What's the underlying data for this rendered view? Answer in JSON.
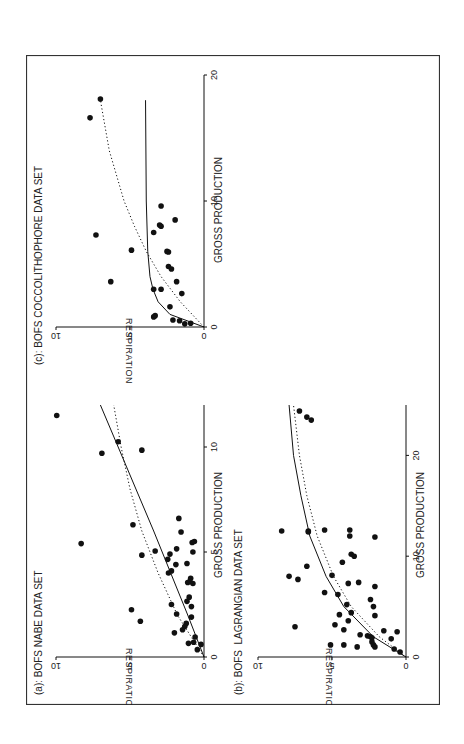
{
  "figure": {
    "rotation_deg": -90,
    "frame_color": "#333333",
    "ink_color": "#111111"
  },
  "chart_data": [
    {
      "id": "a",
      "type": "scatter",
      "title": "(a): BOFS NABE DATA SET",
      "xlabel": "GROSS PRODUCTION",
      "ylabel": "RESPIRATION",
      "xlim": [
        0,
        12
      ],
      "ylim": [
        0,
        10
      ],
      "xticks": [
        0,
        5,
        10
      ],
      "yticks": [
        0,
        5,
        10
      ],
      "grid": false,
      "points": [
        [
          11.5,
          9.95
        ],
        [
          10.25,
          5.8
        ],
        [
          9.7,
          6.9
        ],
        [
          9.85,
          4.2
        ],
        [
          5.4,
          8.3
        ],
        [
          2.25,
          4.9
        ],
        [
          1.7,
          4.3
        ],
        [
          6.3,
          4.8
        ],
        [
          6.6,
          1.7
        ],
        [
          5.95,
          1.55
        ],
        [
          5.45,
          0.8
        ],
        [
          5.5,
          0.65
        ],
        [
          5.0,
          0.75
        ],
        [
          5.05,
          3.3
        ],
        [
          5.15,
          1.85
        ],
        [
          4.9,
          2.3
        ],
        [
          4.85,
          4.2
        ],
        [
          4.65,
          2.45
        ],
        [
          4.45,
          1.15
        ],
        [
          4.4,
          1.9
        ],
        [
          4.1,
          2.2
        ],
        [
          4.0,
          2.4
        ],
        [
          3.75,
          0.9
        ],
        [
          3.6,
          0.95
        ],
        [
          3.55,
          1.1
        ],
        [
          3.5,
          0.75
        ],
        [
          2.85,
          1.0
        ],
        [
          2.65,
          1.15
        ],
        [
          2.5,
          2.2
        ],
        [
          2.4,
          0.85
        ],
        [
          2.05,
          1.85
        ],
        [
          1.9,
          0.85
        ],
        [
          1.6,
          1.2
        ],
        [
          1.45,
          1.3
        ],
        [
          1.3,
          1.45
        ],
        [
          1.15,
          2.0
        ],
        [
          0.95,
          0.6
        ],
        [
          0.7,
          0.7
        ],
        [
          0.65,
          1.05
        ],
        [
          0.6,
          0.2
        ],
        [
          0.35,
          0.45
        ]
      ],
      "series": [
        {
          "name": "solid fit",
          "style": "solid",
          "x": [
            0,
            2,
            4,
            6,
            8,
            10,
            12
          ],
          "y": [
            0,
            1.1,
            2.25,
            3.4,
            4.6,
            5.8,
            7.0
          ]
        },
        {
          "name": "dotted fit",
          "style": "dotted",
          "x": [
            0,
            2,
            4,
            6,
            8,
            10,
            12
          ],
          "y": [
            0,
            1.8,
            3.1,
            4.2,
            5.0,
            5.6,
            6.1
          ]
        }
      ]
    },
    {
      "id": "b",
      "type": "scatter",
      "title": "(b): BOFS  LAGRANGIAN DATA SET",
      "xlabel": "GROSS PRODUCTION",
      "ylabel": "RESPIRATION",
      "xlim": [
        0,
        25
      ],
      "ylim": [
        0,
        10
      ],
      "xticks": [
        0,
        10,
        20
      ],
      "yticks": [
        0,
        5,
        10
      ],
      "grid": false,
      "points": [
        [
          24.4,
          7.2
        ],
        [
          23.8,
          6.7
        ],
        [
          23.5,
          6.4
        ],
        [
          12.5,
          8.4
        ],
        [
          12.5,
          6.6
        ],
        [
          12.4,
          6.6
        ],
        [
          12.6,
          5.5
        ],
        [
          12.6,
          3.8
        ],
        [
          12.0,
          3.8
        ],
        [
          11.9,
          2.1
        ],
        [
          10.2,
          3.7
        ],
        [
          10.0,
          3.5
        ],
        [
          9.4,
          4.3
        ],
        [
          9.0,
          6.7
        ],
        [
          8.1,
          5.0
        ],
        [
          8.0,
          7.9
        ],
        [
          7.7,
          7.3
        ],
        [
          7.4,
          3.2
        ],
        [
          7.3,
          3.9
        ],
        [
          7.0,
          2.1
        ],
        [
          6.4,
          5.5
        ],
        [
          6.2,
          4.6
        ],
        [
          5.7,
          2.4
        ],
        [
          5.2,
          4.0
        ],
        [
          5.0,
          2.2
        ],
        [
          4.4,
          3.7
        ],
        [
          4.2,
          4.5
        ],
        [
          4.1,
          2.1
        ],
        [
          3.6,
          3.9
        ],
        [
          3.2,
          4.8
        ],
        [
          3.0,
          7.5
        ],
        [
          2.7,
          4.2
        ],
        [
          2.6,
          1.5
        ],
        [
          2.5,
          0.6
        ],
        [
          2.2,
          3.1
        ],
        [
          2.1,
          2.6
        ],
        [
          2.0,
          2.4
        ],
        [
          1.9,
          2.3
        ],
        [
          1.8,
          1.0
        ],
        [
          1.5,
          2.3
        ],
        [
          1.2,
          5.1
        ],
        [
          1.2,
          4.2
        ],
        [
          1.2,
          2.2
        ],
        [
          1.0,
          3.3
        ],
        [
          1.0,
          2.1
        ],
        [
          0.8,
          0.8
        ],
        [
          0.5,
          0.4
        ]
      ],
      "series": [
        {
          "name": "solid fit",
          "style": "solid",
          "x": [
            0,
            2,
            5,
            8,
            12,
            16,
            20,
            25
          ],
          "y": [
            0,
            2.2,
            4.2,
            5.4,
            6.5,
            7.1,
            7.6,
            7.9
          ]
        },
        {
          "name": "dotted fit",
          "style": "dotted",
          "x": [
            0,
            2,
            5,
            8,
            12,
            16,
            20,
            25
          ],
          "y": [
            0,
            1.8,
            3.7,
            4.9,
            6.0,
            6.7,
            7.2,
            7.6
          ]
        }
      ]
    },
    {
      "id": "c",
      "type": "scatter",
      "title": "(c): BOFS COCCOLITHOPHORE DATA SET",
      "xlabel": "GROSS PRODUCTION",
      "ylabel": "RESPIRATION",
      "xlim": [
        0,
        20
      ],
      "ylim": [
        0,
        10
      ],
      "xticks": [
        0,
        10,
        20
      ],
      "yticks": [
        0,
        5,
        10
      ],
      "grid": false,
      "points": [
        [
          18.1,
          7.0
        ],
        [
          16.6,
          7.7
        ],
        [
          7.3,
          7.3
        ],
        [
          3.6,
          6.3
        ],
        [
          6.1,
          4.9
        ],
        [
          7.5,
          3.4
        ],
        [
          8.0,
          2.9
        ],
        [
          8.1,
          3.0
        ],
        [
          8.5,
          1.95
        ],
        [
          9.6,
          2.9
        ],
        [
          6.0,
          2.5
        ],
        [
          5.95,
          2.4
        ],
        [
          4.8,
          2.4
        ],
        [
          4.6,
          2.2
        ],
        [
          3.6,
          1.85
        ],
        [
          3.0,
          3.4
        ],
        [
          3.0,
          2.9
        ],
        [
          2.65,
          1.5
        ],
        [
          1.6,
          2.3
        ],
        [
          0.8,
          3.4
        ],
        [
          0.9,
          3.3
        ],
        [
          0.55,
          2.1
        ],
        [
          0.5,
          1.65
        ],
        [
          0.25,
          1.3
        ],
        [
          0.3,
          0.9
        ]
      ],
      "series": [
        {
          "name": "solid fit",
          "style": "solid",
          "x": [
            0,
            1,
            2,
            3,
            4,
            6,
            10,
            18
          ],
          "y": [
            0,
            2.3,
            3.1,
            3.45,
            3.65,
            3.8,
            3.9,
            3.95
          ]
        },
        {
          "name": "dotted fit",
          "style": "dotted",
          "x": [
            0,
            2,
            4,
            6,
            8,
            10,
            14,
            18
          ],
          "y": [
            0,
            1.6,
            2.9,
            3.9,
            4.7,
            5.4,
            6.4,
            7.0
          ]
        }
      ]
    }
  ]
}
